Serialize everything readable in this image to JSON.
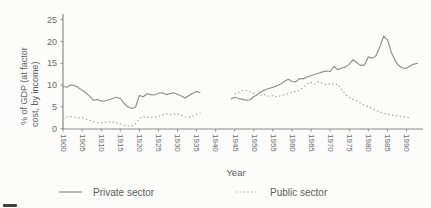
{
  "figure": {
    "background": "#fcfcfa",
    "axis_color": "#8a8a8a",
    "tick_text_color": "#6b6b6b",
    "label_text_color": "#5c5c5c"
  },
  "chart_data": {
    "type": "line",
    "title": "",
    "xlabel": "Year",
    "ylabel": "% of GDP (at factor cost, by income)",
    "ylabel_lines": [
      "% of GDP (at factor",
      "cost, by income)"
    ],
    "xlim": [
      1900,
      1993
    ],
    "ylim": [
      0,
      25
    ],
    "x_ticks": [
      1900,
      1905,
      1910,
      1915,
      1920,
      1925,
      1930,
      1935,
      1940,
      1945,
      1950,
      1955,
      1960,
      1965,
      1970,
      1975,
      1980,
      1985,
      1990
    ],
    "y_ticks": [
      0,
      5,
      10,
      15,
      20,
      25
    ],
    "grid": false,
    "legend_position": "bottom",
    "note": "Data gap during World War II (1937-1943)",
    "series": [
      {
        "name": "Private sector",
        "slug": "private-sector",
        "style": "solid",
        "color": "#8d8d8d",
        "segments": [
          [
            [
              1900,
              9.7
            ],
            [
              1901,
              9.5
            ],
            [
              1902,
              10.0
            ],
            [
              1903,
              9.9
            ],
            [
              1904,
              9.4
            ],
            [
              1905,
              8.8
            ],
            [
              1906,
              8.2
            ],
            [
              1907,
              7.4
            ],
            [
              1908,
              6.5
            ],
            [
              1909,
              6.7
            ],
            [
              1910,
              6.3
            ],
            [
              1911,
              6.4
            ],
            [
              1912,
              6.6
            ],
            [
              1913,
              6.9
            ],
            [
              1914,
              7.2
            ],
            [
              1915,
              6.9
            ],
            [
              1916,
              5.8
            ],
            [
              1917,
              5.0
            ],
            [
              1918,
              4.6
            ],
            [
              1919,
              4.9
            ],
            [
              1920,
              7.6
            ],
            [
              1921,
              7.3
            ],
            [
              1922,
              8.0
            ],
            [
              1923,
              7.8
            ],
            [
              1924,
              7.7
            ],
            [
              1925,
              8.1
            ],
            [
              1926,
              8.2
            ],
            [
              1927,
              7.8
            ],
            [
              1928,
              8.0
            ],
            [
              1929,
              8.2
            ],
            [
              1930,
              7.9
            ],
            [
              1931,
              7.5
            ],
            [
              1932,
              7.0
            ],
            [
              1933,
              7.6
            ],
            [
              1934,
              8.1
            ],
            [
              1935,
              8.5
            ],
            [
              1936,
              8.2
            ]
          ],
          [
            [
              1944,
              6.8
            ],
            [
              1945,
              7.2
            ],
            [
              1946,
              6.9
            ],
            [
              1947,
              6.7
            ],
            [
              1948,
              6.5
            ],
            [
              1949,
              6.6
            ],
            [
              1950,
              7.3
            ],
            [
              1951,
              7.9
            ],
            [
              1952,
              8.5
            ],
            [
              1953,
              8.9
            ],
            [
              1954,
              9.2
            ],
            [
              1955,
              9.5
            ],
            [
              1956,
              9.8
            ],
            [
              1957,
              10.2
            ],
            [
              1958,
              10.8
            ],
            [
              1959,
              11.3
            ],
            [
              1960,
              10.8
            ],
            [
              1961,
              10.7
            ],
            [
              1962,
              11.5
            ],
            [
              1963,
              11.4
            ],
            [
              1964,
              11.9
            ],
            [
              1965,
              12.1
            ],
            [
              1966,
              12.4
            ],
            [
              1967,
              12.7
            ],
            [
              1968,
              13.0
            ],
            [
              1969,
              13.2
            ],
            [
              1970,
              13.1
            ],
            [
              1971,
              14.3
            ],
            [
              1972,
              13.5
            ],
            [
              1973,
              13.9
            ],
            [
              1974,
              14.1
            ],
            [
              1975,
              14.8
            ],
            [
              1976,
              15.8
            ],
            [
              1977,
              15.1
            ],
            [
              1978,
              14.5
            ],
            [
              1979,
              14.6
            ],
            [
              1980,
              16.5
            ],
            [
              1981,
              16.1
            ],
            [
              1982,
              16.7
            ],
            [
              1983,
              18.7
            ],
            [
              1984,
              21.2
            ],
            [
              1985,
              20.4
            ],
            [
              1986,
              17.6
            ],
            [
              1987,
              15.6
            ],
            [
              1988,
              14.4
            ],
            [
              1989,
              13.9
            ],
            [
              1990,
              13.8
            ],
            [
              1991,
              14.4
            ],
            [
              1992,
              14.8
            ],
            [
              1993,
              15.0
            ]
          ]
        ]
      },
      {
        "name": "Public sector",
        "slug": "public-sector",
        "style": "dotted",
        "color": "#a3a3a3",
        "segments": [
          [
            [
              1900,
              2.4
            ],
            [
              1901,
              2.7
            ],
            [
              1902,
              2.8
            ],
            [
              1903,
              2.6
            ],
            [
              1904,
              2.5
            ],
            [
              1905,
              2.4
            ],
            [
              1906,
              2.2
            ],
            [
              1907,
              1.9
            ],
            [
              1908,
              1.6
            ],
            [
              1909,
              1.4
            ],
            [
              1910,
              1.3
            ],
            [
              1911,
              1.4
            ],
            [
              1912,
              1.5
            ],
            [
              1913,
              1.5
            ],
            [
              1914,
              1.3
            ],
            [
              1915,
              1.1
            ],
            [
              1916,
              0.8
            ],
            [
              1917,
              0.6
            ],
            [
              1918,
              0.6
            ],
            [
              1919,
              1.1
            ],
            [
              1920,
              2.3
            ],
            [
              1921,
              2.8
            ],
            [
              1922,
              2.6
            ],
            [
              1923,
              2.5
            ],
            [
              1924,
              2.6
            ],
            [
              1925,
              2.8
            ],
            [
              1926,
              3.1
            ],
            [
              1927,
              3.4
            ],
            [
              1928,
              3.2
            ],
            [
              1929,
              3.3
            ],
            [
              1930,
              3.4
            ],
            [
              1931,
              3.1
            ],
            [
              1932,
              2.7
            ],
            [
              1933,
              2.6
            ],
            [
              1934,
              2.9
            ],
            [
              1935,
              3.3
            ],
            [
              1936,
              3.6
            ]
          ],
          [
            [
              1945,
              7.9
            ],
            [
              1946,
              8.3
            ],
            [
              1947,
              8.7
            ],
            [
              1948,
              8.8
            ],
            [
              1949,
              8.4
            ],
            [
              1950,
              8.0
            ],
            [
              1951,
              7.7
            ],
            [
              1952,
              7.7
            ],
            [
              1953,
              7.8
            ],
            [
              1954,
              7.4
            ],
            [
              1955,
              7.6
            ],
            [
              1956,
              7.3
            ],
            [
              1957,
              7.5
            ],
            [
              1958,
              7.8
            ],
            [
              1959,
              8.0
            ],
            [
              1960,
              8.3
            ],
            [
              1961,
              8.5
            ],
            [
              1962,
              8.8
            ],
            [
              1963,
              9.5
            ],
            [
              1964,
              10.3
            ],
            [
              1965,
              10.6
            ],
            [
              1966,
              10.2
            ],
            [
              1967,
              10.8
            ],
            [
              1968,
              10.4
            ],
            [
              1969,
              10.1
            ],
            [
              1970,
              10.3
            ],
            [
              1971,
              10.0
            ],
            [
              1972,
              10.2
            ],
            [
              1973,
              8.9
            ],
            [
              1974,
              7.9
            ],
            [
              1975,
              7.1
            ],
            [
              1976,
              6.7
            ],
            [
              1977,
              6.3
            ],
            [
              1978,
              5.8
            ],
            [
              1979,
              5.3
            ],
            [
              1980,
              5.0
            ],
            [
              1981,
              4.6
            ],
            [
              1982,
              4.2
            ],
            [
              1983,
              3.8
            ],
            [
              1984,
              3.5
            ],
            [
              1985,
              3.3
            ],
            [
              1986,
              3.1
            ],
            [
              1987,
              3.0
            ],
            [
              1988,
              2.9
            ],
            [
              1989,
              2.8
            ],
            [
              1990,
              2.6
            ],
            [
              1991,
              2.5
            ]
          ]
        ]
      }
    ]
  },
  "legend": {
    "items": [
      {
        "label": "Private sector",
        "style": "solid"
      },
      {
        "label": "Public sector",
        "style": "dotted"
      }
    ]
  }
}
